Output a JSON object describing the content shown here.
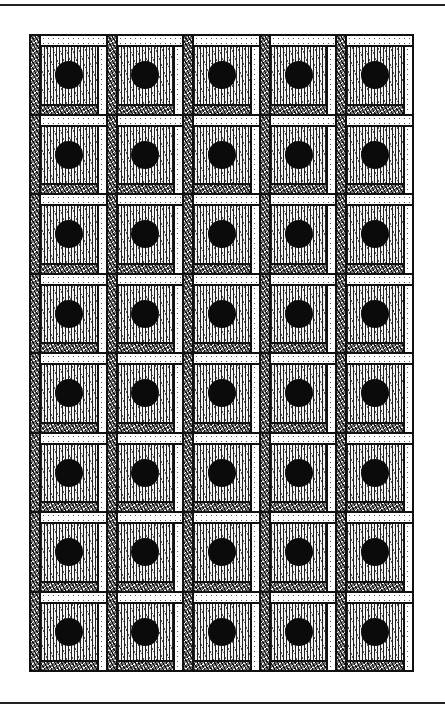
{
  "illustration": {
    "subject": "log cabin quilt pattern with center dots",
    "style": "pen-and-ink",
    "grid": {
      "columns": 5,
      "rows": 8
    },
    "block": {
      "left_strip": "dark-hatched",
      "top_strip": "light-dotted",
      "right_strip": "light-dotted",
      "bottom_strip": "dark-hatched",
      "center": "line-hatched",
      "motif": "black-dot"
    },
    "colors": {
      "ink": "#111111",
      "paper": "#ffffff",
      "dot": "#0b0b0b"
    }
  }
}
